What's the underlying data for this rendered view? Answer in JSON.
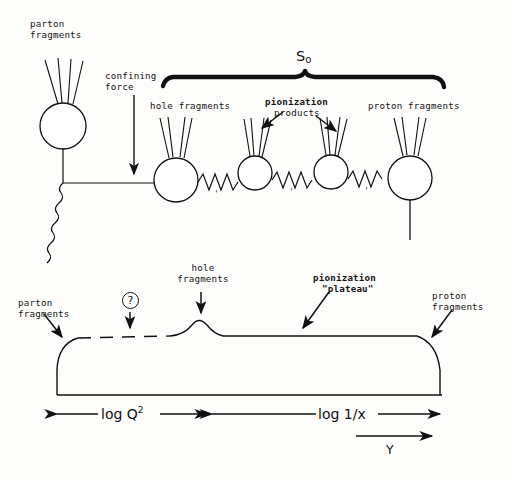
{
  "figure": {
    "ink_color": "#111111",
    "background_color": "#fdfdfb"
  },
  "top_panel": {
    "labels": {
      "parton_fragments": "parton\nfragments",
      "confining_force": "confining\nforce",
      "hole_fragments": "hole fragments",
      "pionization": "pionization",
      "products": "products",
      "proton_fragments": "proton fragments",
      "s_symbol": "S",
      "s_subscript": "o"
    },
    "spring_tick": "'",
    "blob_count": 4,
    "spring_count": 3
  },
  "bottom_panel": {
    "labels": {
      "parton_fragments": "parton\nfragments",
      "question_mark": "?",
      "hole_fragments": "hole\nfragments",
      "pionization_line1": "pionization",
      "pionization_line2": "\"plateau\"",
      "proton_fragments": "proton\nfragments"
    },
    "axes": {
      "left_label": "log Q",
      "left_label_exponent": "2",
      "right_label": "log 1/x",
      "rapidity_label": "Y"
    }
  },
  "chart_data": {
    "type": "area",
    "xlabel": "Y (rapidity)",
    "ylabel": "dN/dY",
    "grid": false,
    "legend": null,
    "regions": [
      {
        "name": "parton fragments",
        "x_range": [
          0.0,
          0.06
        ],
        "note": "left rising edge"
      },
      {
        "name": "log Q^2 (uncertain / dashed)",
        "x_range": [
          0.06,
          0.42
        ],
        "note": "dashed top, marked with '?'"
      },
      {
        "name": "hole fragments",
        "x_range": [
          0.42,
          0.52
        ],
        "note": "small bump above plateau"
      },
      {
        "name": "pionization plateau",
        "x_range": [
          0.52,
          0.94
        ],
        "note": "flat solid top"
      },
      {
        "name": "proton fragments",
        "x_range": [
          0.94,
          1.0
        ],
        "note": "right falling edge"
      }
    ],
    "x": [
      0.0,
      0.02,
      0.05,
      0.08,
      0.15,
      0.25,
      0.35,
      0.42,
      0.45,
      0.47,
      0.5,
      0.53,
      0.6,
      0.7,
      0.8,
      0.9,
      0.95,
      0.98,
      1.0
    ],
    "values": [
      0.0,
      0.55,
      0.88,
      0.95,
      0.96,
      0.96,
      0.96,
      0.96,
      1.02,
      1.08,
      1.02,
      0.96,
      0.96,
      0.96,
      0.96,
      0.95,
      0.85,
      0.45,
      0.0
    ],
    "ylim": [
      0,
      1.2
    ],
    "xlim": [
      0,
      1
    ]
  }
}
